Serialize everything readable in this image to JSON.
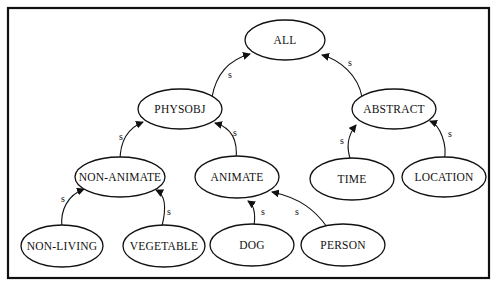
{
  "diagram": {
    "type": "semantic-network-hierarchy",
    "nodes": [
      {
        "id": "all",
        "label": "ALL"
      },
      {
        "id": "physobj",
        "label": "PHYSOBJ"
      },
      {
        "id": "abstract",
        "label": "ABSTRACT"
      },
      {
        "id": "non-animate",
        "label": "NON-ANIMATE"
      },
      {
        "id": "animate",
        "label": "ANIMATE"
      },
      {
        "id": "time",
        "label": "TIME"
      },
      {
        "id": "location",
        "label": "LOCATION"
      },
      {
        "id": "non-living",
        "label": "NON-LIVING"
      },
      {
        "id": "vegetable",
        "label": "VEGETABLE"
      },
      {
        "id": "dog",
        "label": "DOG"
      },
      {
        "id": "person",
        "label": "PERSON"
      }
    ],
    "edges": [
      {
        "from": "physobj",
        "to": "all",
        "label": "s"
      },
      {
        "from": "abstract",
        "to": "all",
        "label": "s"
      },
      {
        "from": "non-animate",
        "to": "physobj",
        "label": "s"
      },
      {
        "from": "animate",
        "to": "physobj",
        "label": "s"
      },
      {
        "from": "time",
        "to": "abstract",
        "label": "s"
      },
      {
        "from": "location",
        "to": "abstract",
        "label": "s"
      },
      {
        "from": "non-living",
        "to": "non-animate",
        "label": "s"
      },
      {
        "from": "vegetable",
        "to": "non-animate",
        "label": "s"
      },
      {
        "from": "dog",
        "to": "animate",
        "label": "s"
      },
      {
        "from": "person",
        "to": "animate",
        "label": "s"
      }
    ]
  }
}
